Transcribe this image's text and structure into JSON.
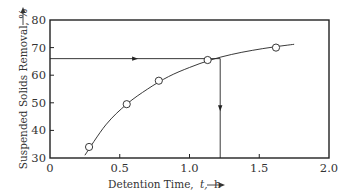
{
  "chart_data": {
    "type": "line",
    "title": "",
    "xlabel": "Detention Time, t, h",
    "ylabel": "Suspended Solids Removal, %",
    "xlim": [
      0,
      2.0
    ],
    "ylim": [
      30,
      80
    ],
    "x_ticks": [
      "0",
      "0.5",
      "1.0",
      "1.5",
      "2.0"
    ],
    "y_ticks": [
      "30",
      "40",
      "50",
      "60",
      "70",
      "80"
    ],
    "grid": false,
    "legend": null,
    "series": [
      {
        "name": "Suspended solids removal (observed)",
        "marker": "open-circle",
        "x": [
          0.28,
          0.55,
          0.78,
          1.13,
          1.62
        ],
        "y": [
          34,
          49.5,
          58,
          65.5,
          70
        ]
      }
    ],
    "fitted_curve": {
      "x": [
        0.25,
        0.4,
        0.55,
        0.7,
        0.85,
        1.0,
        1.15,
        1.3,
        1.45,
        1.6,
        1.75
      ],
      "y": [
        31,
        42,
        49.5,
        55,
        59.5,
        62.8,
        65.5,
        67.5,
        69,
        70.2,
        71.2
      ]
    },
    "annotations": [
      {
        "type": "arrow-line",
        "description": "Horizontal read-off from target removal",
        "y": 66,
        "x_from": 0,
        "x_to": 1.22
      },
      {
        "type": "arrow-line",
        "description": "Vertical drop to required detention time",
        "x": 1.22,
        "y_from": 66,
        "y_to": 30
      }
    ]
  },
  "labels": {
    "xlabel": "Detention Time,",
    "xlabel_var": "t,",
    "xlabel_unit": "h",
    "ylabel": "Suspended Solids Removal, %"
  }
}
